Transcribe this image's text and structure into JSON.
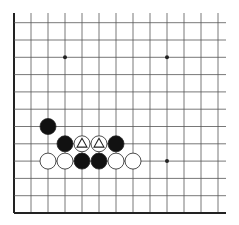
{
  "diagram": {
    "type": "go-board-fragment",
    "board_colors": {
      "background": "#ffffff",
      "line": "#555555",
      "edge": "#222222",
      "black_stone": "#111111",
      "white_stone": "#ffffff",
      "stone_outline": "#222222"
    },
    "grid": {
      "columns": 13,
      "rows": 12,
      "origin_x": 14,
      "bottom_y": 213,
      "spacing_x": 17,
      "spacing_y": 17.3,
      "left_edge": true,
      "bottom_edge": true
    },
    "star_points": [
      {
        "col": 3,
        "row": 9
      },
      {
        "col": 9,
        "row": 9
      },
      {
        "col": 9,
        "row": 3
      }
    ],
    "stones": [
      {
        "color": "black",
        "col": 2,
        "row": 5,
        "marker": ""
      },
      {
        "color": "black",
        "col": 3,
        "row": 4,
        "marker": ""
      },
      {
        "color": "white",
        "col": 4,
        "row": 4,
        "marker": "triangle"
      },
      {
        "color": "white",
        "col": 5,
        "row": 4,
        "marker": "triangle"
      },
      {
        "color": "black",
        "col": 6,
        "row": 4,
        "marker": ""
      },
      {
        "color": "white",
        "col": 2,
        "row": 3,
        "marker": ""
      },
      {
        "color": "white",
        "col": 3,
        "row": 3,
        "marker": ""
      },
      {
        "color": "black",
        "col": 4,
        "row": 3,
        "marker": ""
      },
      {
        "color": "black",
        "col": 5,
        "row": 3,
        "marker": ""
      },
      {
        "color": "white",
        "col": 6,
        "row": 3,
        "marker": ""
      },
      {
        "color": "white",
        "col": 7,
        "row": 3,
        "marker": ""
      }
    ]
  }
}
